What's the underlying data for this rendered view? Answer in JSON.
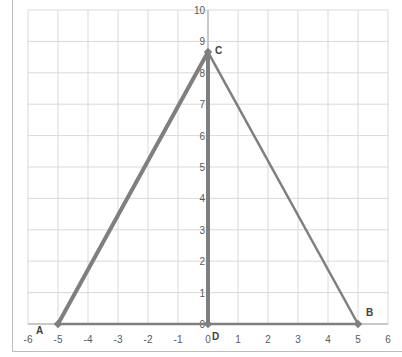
{
  "chart_data": {
    "type": "line",
    "title": "",
    "xlabel": "",
    "ylabel": "",
    "xlim": [
      -6,
      6
    ],
    "ylim": [
      0,
      10
    ],
    "grid": true,
    "legend": null,
    "x_ticks": [
      "-6",
      "-5",
      "-4",
      "-3",
      "-2",
      "-1",
      "0",
      "1",
      "2",
      "3",
      "4",
      "5",
      "6"
    ],
    "y_ticks": [
      "0",
      "1",
      "2",
      "3",
      "4",
      "5",
      "6",
      "7",
      "8",
      "9",
      "10"
    ],
    "points": [
      {
        "label": "A",
        "x": -5,
        "y": 0
      },
      {
        "label": "B",
        "x": 5,
        "y": 0
      },
      {
        "label": "C",
        "x": 0,
        "y": 8.66
      },
      {
        "label": "D",
        "x": 0,
        "y": 0
      }
    ],
    "series": [
      {
        "name": "AC",
        "x": [
          -5,
          0
        ],
        "y": [
          0,
          8.66
        ],
        "width": "thick"
      },
      {
        "name": "CB",
        "x": [
          0,
          5
        ],
        "y": [
          8.66,
          0
        ],
        "width": "normal"
      },
      {
        "name": "AB",
        "x": [
          -5,
          5
        ],
        "y": [
          0,
          0
        ],
        "width": "normal"
      },
      {
        "name": "CD",
        "x": [
          0,
          0
        ],
        "y": [
          8.66,
          0
        ],
        "width": "thick"
      }
    ],
    "colors": {
      "line": "#7f7f7f",
      "grid": "#d9d9d9",
      "text": "#595959"
    }
  }
}
